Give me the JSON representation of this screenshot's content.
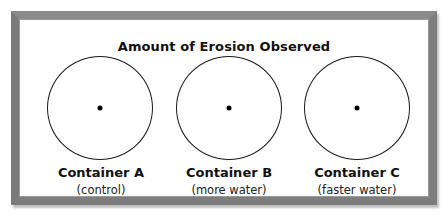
{
  "title": "Amount of Erosion Observed",
  "containers": [
    {
      "label": "Container A",
      "note": "(control)"
    },
    {
      "label": "Container B",
      "note": "(more water)"
    },
    {
      "label": "Container C",
      "note": "(faster water)"
    }
  ],
  "colors": {
    "border": "#7d7d7d",
    "background": "#ffffff",
    "ink": "#111111"
  }
}
